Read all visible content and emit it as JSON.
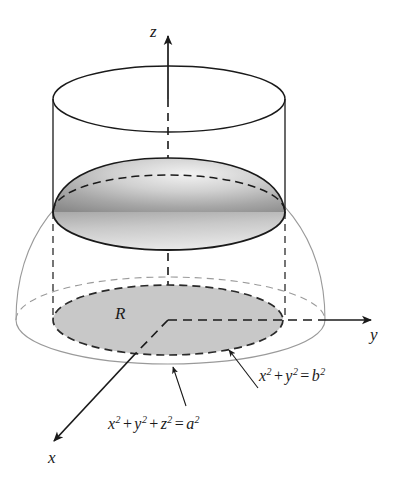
{
  "figure": {
    "kind": "3d-solid-region-diagram",
    "background_color": "#ffffff",
    "ink_color": "#1a1a1a",
    "axes": [
      {
        "name": "z",
        "label": "z",
        "direction": "up"
      },
      {
        "name": "y",
        "label": "y",
        "direction": "right"
      },
      {
        "name": "x",
        "label": "x",
        "direction": "lower-left"
      }
    ],
    "region_label": "R",
    "equations": {
      "cylinder": {
        "terms": [
          "x",
          "2",
          "+",
          "y",
          "2",
          "=",
          "b",
          "2"
        ],
        "text": "x² + y² = b²",
        "base": [
          "x",
          "y",
          "b"
        ],
        "exponents": [
          "2",
          "2",
          "2"
        ]
      },
      "sphere": {
        "terms": [
          "x",
          "2",
          "+",
          "y",
          "2",
          "+",
          "z",
          "2",
          "=",
          "a",
          "2"
        ],
        "text": "x² + y² + z² = a²",
        "base": [
          "x",
          "y",
          "z",
          "a"
        ],
        "exponents": [
          "2",
          "2",
          "2",
          "2"
        ]
      }
    },
    "shading": {
      "disk_fill": "#c8c8c8",
      "cap_fill_light": "#efefef",
      "cap_fill_dark": "#8f8f8f",
      "sphere_outline": "#9a9a9a"
    }
  }
}
